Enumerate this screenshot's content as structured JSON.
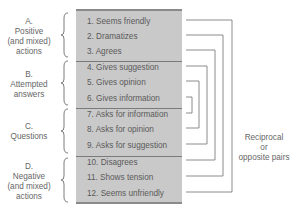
{
  "groups": [
    {
      "letter": "A.",
      "line1": "Positive",
      "line2": "(and mixed)",
      "line3": "actions"
    },
    {
      "letter": "B.",
      "line1": "Attempted",
      "line2": "answers",
      "line3": ""
    },
    {
      "letter": "C.",
      "line1": "Questions",
      "line2": "",
      "line3": ""
    },
    {
      "letter": "D.",
      "line1": "Negative",
      "line2": "(and mixed)",
      "line3": "actions"
    }
  ],
  "items": [
    "1. Seems friendly",
    "2. Dramatizes",
    "3. Agrees",
    "4. Gives suggestion",
    "5. Gives opinion",
    "6. Gives information",
    "7. Asks for information",
    "8. Asks for opinion",
    "9. Asks for suggestion",
    "10. Disagrees",
    "11. Shows tension",
    "12. Seems unfriendly"
  ],
  "side_label": {
    "line1": "Reciprocal",
    "line2": "or",
    "line3": "opposite pairs"
  },
  "pairs": [
    [
      1,
      12
    ],
    [
      2,
      11
    ],
    [
      3,
      10
    ],
    [
      4,
      9
    ],
    [
      5,
      8
    ],
    [
      6,
      7
    ]
  ],
  "colors": {
    "box_fill": "#c9c9c9",
    "lines": "#6e6e6e",
    "text": "#5a5a5a"
  }
}
